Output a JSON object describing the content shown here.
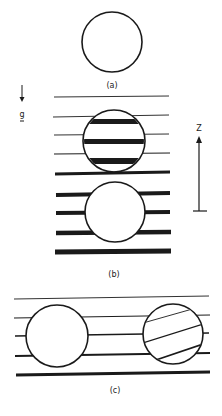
{
  "figure": {
    "panels": [
      {
        "id": "a",
        "label": "(a)",
        "description": "Isolated sphere (bubble/particle)"
      },
      {
        "id": "b",
        "label": "(b)",
        "description": "Two spheres aligned vertically in stratified fluid; upper sphere carries dense stripes"
      },
      {
        "id": "c",
        "label": "(c)",
        "description": "Two spheres side by side in stratified fluid; right sphere with tilted internal layers"
      }
    ],
    "gravity_label": "g",
    "axis_label": "Z",
    "ink_color": "#1a1a1a"
  }
}
